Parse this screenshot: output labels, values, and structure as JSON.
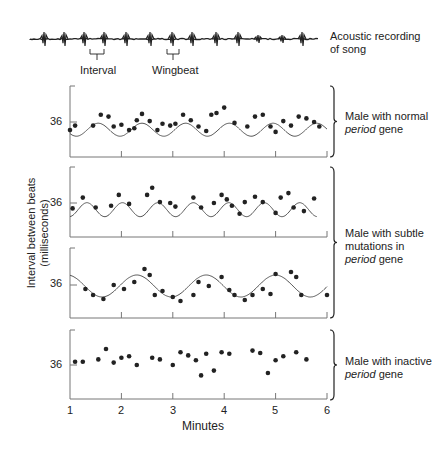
{
  "chart_data": [
    {
      "type": "scatter",
      "title": "Male with normal period gene",
      "xlabel": "Minutes",
      "ylabel": "Interval between beats (milliseconds)",
      "ytick": 36,
      "xlim": [
        1,
        6
      ],
      "fit_curve": "sinusoid, period ~0.85 min",
      "points": [
        [
          1.0,
          35.1
        ],
        [
          1.1,
          35.6
        ],
        [
          1.45,
          35.6
        ],
        [
          1.6,
          36.8
        ],
        [
          1.75,
          36.6
        ],
        [
          1.85,
          35.5
        ],
        [
          2.0,
          35.7
        ],
        [
          2.15,
          35.1
        ],
        [
          2.25,
          35.3
        ],
        [
          2.3,
          36.2
        ],
        [
          2.4,
          36.9
        ],
        [
          2.55,
          36.1
        ],
        [
          2.7,
          35.1
        ],
        [
          2.8,
          35.8
        ],
        [
          2.95,
          35.6
        ],
        [
          3.05,
          35.8
        ],
        [
          3.2,
          36.8
        ],
        [
          3.35,
          36.2
        ],
        [
          3.5,
          35.5
        ],
        [
          3.65,
          35.0
        ],
        [
          3.75,
          36.8
        ],
        [
          3.85,
          37.0
        ],
        [
          4.0,
          37.6
        ],
        [
          4.2,
          35.9
        ],
        [
          4.45,
          35.5
        ],
        [
          4.6,
          36.6
        ],
        [
          4.75,
          36.8
        ],
        [
          4.9,
          35.5
        ],
        [
          5.0,
          34.9
        ],
        [
          5.15,
          36.1
        ],
        [
          5.3,
          35.6
        ],
        [
          5.45,
          36.6
        ],
        [
          5.6,
          36.4
        ],
        [
          5.75,
          36.0
        ],
        [
          5.85,
          35.5
        ]
      ]
    },
    {
      "type": "scatter",
      "title": "Male with subtle mutations in period gene (short period)",
      "ytick": 36,
      "xlim": [
        1,
        6
      ],
      "fit_curve": "sinusoid, period ~0.7 min",
      "points": [
        [
          1.05,
          35.4
        ],
        [
          1.25,
          36.6
        ],
        [
          1.5,
          35.5
        ],
        [
          1.8,
          35.7
        ],
        [
          1.95,
          36.9
        ],
        [
          2.15,
          35.9
        ],
        [
          2.5,
          36.9
        ],
        [
          2.6,
          37.7
        ],
        [
          2.75,
          36.1
        ],
        [
          2.95,
          36.0
        ],
        [
          3.05,
          35.6
        ],
        [
          3.4,
          36.6
        ],
        [
          3.55,
          35.5
        ],
        [
          3.8,
          36.0
        ],
        [
          3.95,
          36.9
        ],
        [
          4.05,
          36.4
        ],
        [
          4.15,
          35.7
        ],
        [
          4.3,
          34.8
        ],
        [
          4.4,
          36.1
        ],
        [
          4.6,
          36.7
        ],
        [
          4.75,
          36.1
        ],
        [
          5.0,
          34.9
        ],
        [
          5.1,
          36.6
        ],
        [
          5.25,
          37.1
        ],
        [
          5.35,
          35.5
        ],
        [
          5.55,
          35.1
        ],
        [
          5.75,
          36.5
        ]
      ]
    },
    {
      "type": "scatter",
      "title": "Male with subtle mutations in period gene (long period)",
      "ytick": 36,
      "xlim": [
        1,
        6
      ],
      "fit_curve": "sinusoid, period ~1.35 min",
      "points": [
        [
          1.3,
          35.6
        ],
        [
          1.45,
          35.0
        ],
        [
          1.65,
          34.6
        ],
        [
          1.85,
          36.0
        ],
        [
          2.05,
          35.6
        ],
        [
          2.25,
          36.3
        ],
        [
          2.45,
          37.6
        ],
        [
          2.55,
          37.0
        ],
        [
          2.65,
          35.0
        ],
        [
          2.8,
          35.4
        ],
        [
          3.0,
          34.8
        ],
        [
          3.15,
          34.4
        ],
        [
          3.4,
          35.0
        ],
        [
          3.5,
          36.3
        ],
        [
          3.7,
          35.9
        ],
        [
          3.95,
          36.8
        ],
        [
          4.1,
          35.5
        ],
        [
          4.2,
          35.0
        ],
        [
          4.4,
          34.5
        ],
        [
          4.55,
          35.0
        ],
        [
          4.75,
          35.6
        ],
        [
          4.9,
          35.1
        ],
        [
          5.0,
          37.1
        ],
        [
          5.3,
          37.3
        ],
        [
          5.4,
          36.8
        ],
        [
          5.5,
          35.0
        ],
        [
          6.0,
          35.0
        ]
      ]
    },
    {
      "type": "scatter",
      "title": "Male with inactive period gene",
      "ytick": 36,
      "xlim": [
        1,
        6
      ],
      "fit_curve": "none",
      "points": [
        [
          1.1,
          36.4
        ],
        [
          1.25,
          36.4
        ],
        [
          1.55,
          36.7
        ],
        [
          1.7,
          38.0
        ],
        [
          1.85,
          36.3
        ],
        [
          2.0,
          36.9
        ],
        [
          2.15,
          37.1
        ],
        [
          2.3,
          36.0
        ],
        [
          2.6,
          36.9
        ],
        [
          2.75,
          36.7
        ],
        [
          3.0,
          36.0
        ],
        [
          3.15,
          37.6
        ],
        [
          3.3,
          37.2
        ],
        [
          3.45,
          36.6
        ],
        [
          3.55,
          34.7
        ],
        [
          3.65,
          37.4
        ],
        [
          3.8,
          35.3
        ],
        [
          3.95,
          37.6
        ],
        [
          4.1,
          37.4
        ],
        [
          4.55,
          37.8
        ],
        [
          4.7,
          37.5
        ],
        [
          4.85,
          35.0
        ],
        [
          5.0,
          36.6
        ],
        [
          5.15,
          37.1
        ],
        [
          5.4,
          37.6
        ],
        [
          5.6,
          36.7
        ]
      ]
    }
  ],
  "header": {
    "song_label_line1": "Acoustic recording",
    "song_label_line2": "of song",
    "interval_label": "Interval",
    "wingbeat_label": "Wingbeat"
  },
  "axes": {
    "ylabel_line1": "Interval between beats",
    "ylabel_line2": "(milliseconds)",
    "ytick_label": "36",
    "xlabel": "Minutes",
    "xticks": [
      "1",
      "2",
      "3",
      "4",
      "5",
      "6"
    ]
  },
  "legend": {
    "normal_line1": "Male with normal",
    "normal_italic": "period",
    "normal_rest": " gene",
    "subtle_line1": "Male with subtle",
    "subtle_line2": "mutations in",
    "subtle_italic": "period",
    "subtle_rest": " gene",
    "inactive_line1": "Male with inactive",
    "inactive_italic": "period",
    "inactive_rest": " gene"
  },
  "colors": {
    "ink": "#222222",
    "curve": "#555555",
    "axis": "#777777"
  }
}
